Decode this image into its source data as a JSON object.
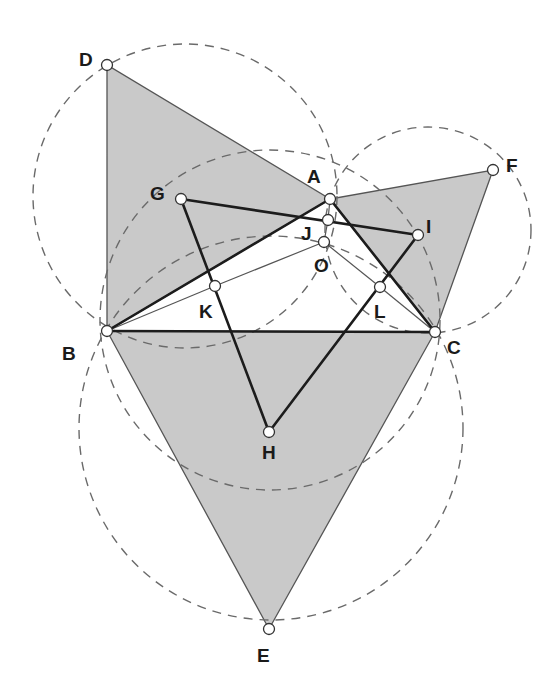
{
  "figure": {
    "colors": {
      "shading": "#c9c9c9",
      "lines": "#1c1c1c",
      "dashed_circles": "#6a6a6a",
      "background": "#ffffff"
    }
  },
  "points": {
    "A": {
      "label": "A",
      "x": 330,
      "y": 199,
      "lx": 307,
      "ly": 183
    },
    "B": {
      "label": "B",
      "x": 107,
      "y": 331,
      "lx": 62,
      "ly": 360
    },
    "C": {
      "label": "C",
      "x": 435,
      "y": 332,
      "lx": 447,
      "ly": 354
    },
    "D": {
      "label": "D",
      "x": 107,
      "y": 65,
      "lx": 79,
      "ly": 66
    },
    "E": {
      "label": "E",
      "x": 269,
      "y": 629,
      "lx": 257,
      "ly": 662
    },
    "F": {
      "label": "F",
      "x": 493,
      "y": 170,
      "lx": 506,
      "ly": 172
    },
    "G": {
      "label": "G",
      "x": 181,
      "y": 199,
      "lx": 150,
      "ly": 200
    },
    "H": {
      "label": "H",
      "x": 269,
      "y": 432,
      "lx": 262,
      "ly": 459
    },
    "I": {
      "label": "I",
      "x": 418,
      "y": 235,
      "lx": 426,
      "ly": 233
    },
    "J": {
      "label": "J",
      "x": 328,
      "y": 220,
      "lx": 301,
      "ly": 240
    },
    "K": {
      "label": "K",
      "x": 215,
      "y": 286,
      "lx": 199,
      "ly": 318
    },
    "L": {
      "label": "L",
      "x": 380,
      "y": 287,
      "lx": 374,
      "ly": 318
    },
    "O": {
      "label": "O",
      "x": 324,
      "y": 242,
      "lx": 314,
      "ly": 272
    }
  },
  "shaded_triangles": [
    {
      "name": "triangle-ABD",
      "vertices": [
        "A",
        "B",
        "D"
      ]
    },
    {
      "name": "triangle-ACF",
      "vertices": [
        "A",
        "C",
        "F"
      ]
    },
    {
      "name": "triangle-BCE",
      "vertices": [
        "B",
        "C",
        "E"
      ]
    }
  ],
  "dashed_circles": [
    {
      "name": "circumcircle-ABD",
      "cx": 185,
      "cy": 196,
      "r": 152
    },
    {
      "name": "circumcircle-ACF",
      "cx": 428,
      "cy": 230,
      "r": 103
    },
    {
      "name": "circumcircle-BCE",
      "cx": 271,
      "cy": 428,
      "r": 192
    },
    {
      "name": "circle-BOC",
      "cx": 270,
      "cy": 320,
      "r": 170
    }
  ],
  "thick_segments": [
    [
      "B",
      "C"
    ],
    [
      "B",
      "A"
    ],
    [
      "A",
      "C"
    ],
    [
      "G",
      "I"
    ],
    [
      "G",
      "H"
    ],
    [
      "H",
      "I"
    ]
  ],
  "thin_segments": [
    [
      "B",
      "K"
    ],
    [
      "K",
      "O"
    ],
    [
      "O",
      "L"
    ],
    [
      "L",
      "C"
    ],
    [
      "A",
      "J"
    ],
    [
      "J",
      "O"
    ]
  ]
}
